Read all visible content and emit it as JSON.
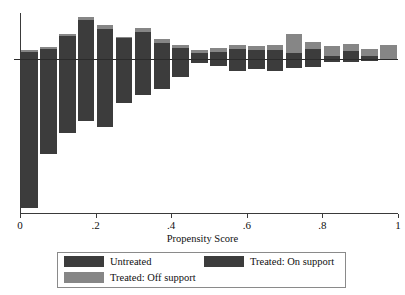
{
  "chart_data": {
    "type": "bar",
    "title": "",
    "subtitle": "",
    "xlabel": "Propensity Score",
    "ylabel": "",
    "xlim": [
      0,
      1
    ],
    "xticks": [
      0,
      0.2,
      0.4,
      0.6,
      0.8,
      1
    ],
    "xticklabels": [
      "0",
      ".2",
      ".4",
      ".6",
      ".8",
      "1"
    ],
    "grid": false,
    "orientation": "back-to-back-histogram",
    "zero_line": true,
    "legend_position": "below-axis",
    "series": [
      {
        "name": "Untreated",
        "color": "#3c3c3c",
        "direction": "down"
      },
      {
        "name": "Treated: On support",
        "color": "#3c3c3c",
        "direction": "up"
      },
      {
        "name": "Treated: Off support",
        "color": "#868686",
        "direction": "up"
      }
    ],
    "bins": [
      {
        "x_center": 0.025,
        "treated_on": 0.17,
        "treated_off": 0.04,
        "untreated": 2.7
      },
      {
        "x_center": 0.075,
        "treated_on": 0.22,
        "treated_off": 0.05,
        "untreated": 1.72
      },
      {
        "x_center": 0.125,
        "treated_on": 0.52,
        "treated_off": 0.04,
        "untreated": 1.34
      },
      {
        "x_center": 0.175,
        "treated_on": 0.88,
        "treated_off": 0.09,
        "untreated": 1.12
      },
      {
        "x_center": 0.225,
        "treated_on": 0.68,
        "treated_off": 0.09,
        "untreated": 1.23
      },
      {
        "x_center": 0.275,
        "treated_on": 0.48,
        "treated_off": 0.02,
        "untreated": 0.8
      },
      {
        "x_center": 0.325,
        "treated_on": 0.62,
        "treated_off": 0.08,
        "untreated": 0.65
      },
      {
        "x_center": 0.375,
        "treated_on": 0.37,
        "treated_off": 0.09,
        "untreated": 0.55
      },
      {
        "x_center": 0.425,
        "treated_on": 0.24,
        "treated_off": 0.09,
        "untreated": 0.33
      },
      {
        "x_center": 0.475,
        "treated_on": 0.14,
        "treated_off": 0.06,
        "untreated": 0.07
      },
      {
        "x_center": 0.525,
        "treated_on": 0.17,
        "treated_off": 0.07,
        "untreated": 0.12
      },
      {
        "x_center": 0.575,
        "treated_on": 0.23,
        "treated_off": 0.1,
        "untreated": 0.21
      },
      {
        "x_center": 0.625,
        "treated_on": 0.2,
        "treated_off": 0.1,
        "untreated": 0.18
      },
      {
        "x_center": 0.675,
        "treated_on": 0.21,
        "treated_off": 0.1,
        "untreated": 0.22
      },
      {
        "x_center": 0.725,
        "treated_on": 0.13,
        "treated_off": 0.43,
        "untreated": 0.17
      },
      {
        "x_center": 0.775,
        "treated_on": 0.22,
        "treated_off": 0.16,
        "untreated": 0.15
      },
      {
        "x_center": 0.825,
        "treated_on": 0.06,
        "treated_off": 0.24,
        "untreated": 0.05
      },
      {
        "x_center": 0.875,
        "treated_on": 0.19,
        "treated_off": 0.16,
        "untreated": 0.06
      },
      {
        "x_center": 0.925,
        "treated_on": 0.07,
        "treated_off": 0.16,
        "untreated": 0.04
      },
      {
        "x_center": 0.975,
        "treated_on": 0.0,
        "treated_off": 0.32,
        "untreated": 0.0
      }
    ]
  },
  "axis": {
    "x_title": "Propensity Score",
    "tick_labels": [
      "0",
      ".2",
      ".4",
      ".6",
      ".8",
      "1"
    ]
  },
  "legend": {
    "untreated_label": "Untreated",
    "on_support_label": "Treated: On support",
    "off_support_label": "Treated: Off support"
  },
  "colors": {
    "dark_grey": "#3c3c3c",
    "light_grey": "#868686",
    "axis": "#3a3a3a",
    "background": "#ffffff"
  }
}
